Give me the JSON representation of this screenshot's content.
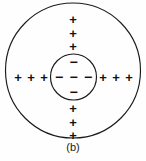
{
  "figure": {
    "caption": "(b)",
    "colors": {
      "background": "#fefefe",
      "stroke": "#1a1a1a",
      "glyph": "#111111"
    },
    "outer_shell": {
      "name": "outer-circle",
      "cx": 73,
      "cy": 70.5,
      "r": 67.5
    },
    "inner_core": {
      "name": "inner-circle",
      "cx": 73.5,
      "cy": 77,
      "r": 23
    },
    "positive_symbol": "+",
    "negative_symbol": "−",
    "positive_charges": [
      {
        "label": "+",
        "x": 73,
        "y": 19
      },
      {
        "label": "+",
        "x": 73,
        "y": 33
      },
      {
        "label": "+",
        "x": 73,
        "y": 46
      },
      {
        "label": "+",
        "x": 73,
        "y": 108
      },
      {
        "label": "+",
        "x": 73,
        "y": 122
      },
      {
        "label": "+",
        "x": 73,
        "y": 135
      },
      {
        "label": "+",
        "x": 18,
        "y": 77
      },
      {
        "label": "+",
        "x": 31,
        "y": 77
      },
      {
        "label": "+",
        "x": 44,
        "y": 77
      },
      {
        "label": "+",
        "x": 103,
        "y": 77
      },
      {
        "label": "+",
        "x": 116,
        "y": 77
      },
      {
        "label": "+",
        "x": 129,
        "y": 77
      }
    ],
    "negative_charges": [
      {
        "label": "−",
        "x": 73.5,
        "y": 62
      },
      {
        "label": "−",
        "x": 73.5,
        "y": 92
      },
      {
        "label": "−",
        "x": 59,
        "y": 77
      },
      {
        "label": "−",
        "x": 73.5,
        "y": 77
      },
      {
        "label": "−",
        "x": 88,
        "y": 77
      }
    ]
  }
}
